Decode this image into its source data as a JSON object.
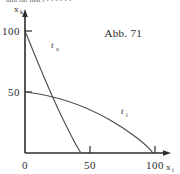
{
  "figure": {
    "caption": "Abb. 71",
    "top_cut_text": "und für den t - - - - - -",
    "axes": {
      "x_label_base": "x",
      "x_label_sub": "i",
      "y_label_base": "x",
      "y_label_sub": "k",
      "x_ticks": [
        {
          "value": 0,
          "label": "0",
          "px": 25
        },
        {
          "value": 50,
          "label": "50",
          "px": 90
        },
        {
          "value": 100,
          "label": "100",
          "px": 155
        }
      ],
      "y_ticks": [
        {
          "value": 50,
          "label": "50",
          "px": 92
        },
        {
          "value": 100,
          "label": "100",
          "px": 31
        }
      ],
      "origin": {
        "x_px": 25,
        "y_px": 153
      },
      "xlim": [
        0,
        115
      ],
      "ylim": [
        0,
        118
      ]
    },
    "curves": [
      {
        "name": "t_a",
        "label_base": "t",
        "label_sub": "a",
        "label_pos": {
          "x_px": 53,
          "y_px": 48
        },
        "path": "M25,31 C35,52 48,88 62,116 C72,136 78,148 81,153",
        "intercepts": {
          "y": 100,
          "x": 50
        }
      },
      {
        "name": "t_i",
        "label_base": "t",
        "label_sub": "i",
        "label_pos": {
          "x_px": 122,
          "y_px": 114
        },
        "path": "M25,92 C50,95 80,103 108,118 C130,130 146,144 152,153",
        "intercepts": {
          "y": 50,
          "x": 100
        }
      }
    ],
    "colors": {
      "axis": "#2b2b2b",
      "curve": "#4a4a4a",
      "text": "#2b2b2b",
      "background": "#ffffff"
    }
  }
}
